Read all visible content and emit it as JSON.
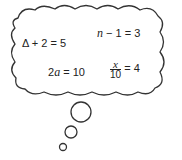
{
  "diagram": {
    "type": "thought-bubble",
    "equations": [
      {
        "id": "delta",
        "lhs_symbol": "Δ",
        "rest": " + 2 = 5"
      },
      {
        "id": "n",
        "var": "n",
        "rest": " − 1 = 3"
      },
      {
        "id": "a",
        "coef": "2",
        "var": "a",
        "rest": " = 10"
      },
      {
        "id": "x",
        "num": "x",
        "den": "10",
        "rest": " = 4"
      }
    ],
    "colors": {
      "stroke": "#333333",
      "text": "#222222",
      "background": "#ffffff"
    }
  }
}
